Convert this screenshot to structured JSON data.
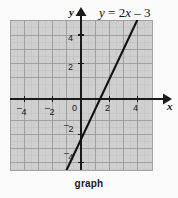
{
  "caption": "graph",
  "equation": {
    "lhs": "y",
    "equals": " = ",
    "coefficient": "2",
    "variable": "x",
    "operator": " – ",
    "constant": "3",
    "full": "y = 2x – 3"
  },
  "axes": {
    "x_label": "x",
    "y_label": "y"
  },
  "colors": {
    "page_background": "#fafafa",
    "plot_background": "#cfcfcf",
    "major_grid": "#9a9a9a",
    "minor_grid": "#c0c0c0",
    "axis": "#1a1a1a",
    "line": "#111111",
    "text": "#161616"
  },
  "chart_data": {
    "type": "line",
    "title": "y = 2x – 3",
    "xlabel": "x",
    "ylabel": "y",
    "xlim": [
      -5,
      5
    ],
    "ylim": [
      -5.3,
      5.3
    ],
    "grid": true,
    "minor_grid_step": 0.5,
    "major_grid_step": 1,
    "legend": "none",
    "x_ticks": [
      -4,
      -2,
      0,
      2,
      4
    ],
    "x_tick_labels": [
      "⁻4",
      "⁻2",
      "0",
      "2",
      "4"
    ],
    "y_ticks": [
      4,
      2,
      -2,
      -4
    ],
    "y_tick_labels": [
      "4",
      "2",
      "⁻2",
      "⁻4"
    ],
    "series": [
      {
        "name": "y = 2x – 3",
        "equation": "y = 2x - 3",
        "slope": 2,
        "y_intercept": -3,
        "x_intercept": 1.5,
        "x": [
          -1.15,
          4.0
        ],
        "y": [
          -5.3,
          5.0
        ],
        "points": [
          {
            "x": 0,
            "y": -3
          },
          {
            "x": 1.5,
            "y": 0
          },
          {
            "x": 4,
            "y": 5
          }
        ]
      }
    ]
  },
  "tick_labels": {
    "x": [
      {
        "id": "x-neg-4",
        "neg": "–",
        "value": "4",
        "left": 17,
        "top": 103
      },
      {
        "id": "x-neg-2",
        "neg": "–",
        "value": "2",
        "left": 45,
        "top": 103
      },
      {
        "id": "x-0",
        "neg": "",
        "value": "0",
        "left": 72,
        "top": 103
      },
      {
        "id": "x-2",
        "neg": "",
        "value": "2",
        "left": 105,
        "top": 103
      },
      {
        "id": "x-4",
        "neg": "",
        "value": "4",
        "left": 133,
        "top": 103
      }
    ],
    "y": [
      {
        "id": "y-4",
        "neg": "",
        "value": "4",
        "left": 68,
        "top": 33
      },
      {
        "id": "y-2",
        "neg": "",
        "value": "2",
        "left": 68,
        "top": 62
      },
      {
        "id": "y-neg-2",
        "neg": "–",
        "value": "2",
        "left": 64,
        "top": 120
      },
      {
        "id": "y-neg-4",
        "neg": "–",
        "value": "4",
        "left": 64,
        "top": 148
      }
    ]
  }
}
